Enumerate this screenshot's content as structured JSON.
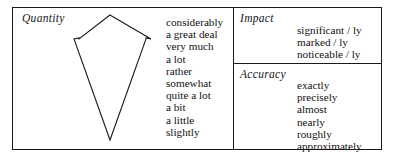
{
  "diagram": {
    "title": "",
    "sections": [
      {
        "id": "quantity",
        "heading": "Quantity",
        "items": [
          "considerably",
          "a great deal",
          "very much",
          "a lot",
          "rather",
          "somewhat",
          "quite a lot",
          "a bit",
          "a little",
          "slightly"
        ]
      },
      {
        "id": "impact",
        "heading": "Impact",
        "items": [
          "significant / ly",
          "marked / ly",
          "noticeable / ly"
        ]
      },
      {
        "id": "accuracy",
        "heading": "Accuracy",
        "items": [
          "exactly",
          "precisely",
          "almost",
          "nearly",
          "roughly",
          "approximately"
        ]
      }
    ],
    "arrow": {
      "name": "downward-arrow",
      "direction": "down",
      "meaning": "decreasing degree",
      "stroke_color": "#1a1a1a"
    },
    "colors": {
      "background": "#ffffff",
      "border": "#1a1a1a",
      "text": "#111111"
    }
  }
}
